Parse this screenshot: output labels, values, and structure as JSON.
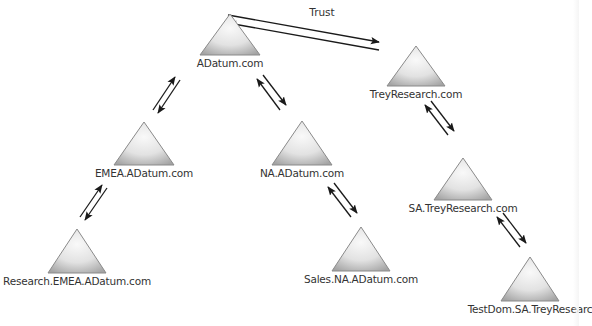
{
  "diagram": {
    "title": "",
    "trust_label": "Trust",
    "colors": {
      "triangle_stroke": "#8a8a8a",
      "triangle_fill_light": "#f7f7f7",
      "triangle_fill_dark": "#a8a8a8",
      "arrow": "#1a1a1a",
      "label_text": "#333333"
    },
    "nodes": [
      {
        "id": "adatum",
        "label": "ADatum.com",
        "cx": 230,
        "top": 14,
        "base": 55,
        "half": 30
      },
      {
        "id": "treyresearch",
        "label": "TreyResearch.com",
        "cx": 416,
        "top": 46,
        "base": 86,
        "half": 29
      },
      {
        "id": "emea",
        "label": "EMEA.ADatum.com",
        "cx": 144,
        "top": 122,
        "base": 165,
        "half": 30
      },
      {
        "id": "na",
        "label": "NA.ADatum.com",
        "cx": 302,
        "top": 121,
        "base": 165,
        "half": 30
      },
      {
        "id": "sa",
        "label": "SA.TreyResearch.com",
        "cx": 463,
        "top": 158,
        "base": 200,
        "half": 29
      },
      {
        "id": "research-emea",
        "label": "Research.EMEA.ADatum.com",
        "cx": 77,
        "top": 229,
        "base": 273,
        "half": 29
      },
      {
        "id": "sales-na",
        "label": "Sales.NA.ADatum.com",
        "cx": 361,
        "top": 227,
        "base": 271,
        "half": 29
      },
      {
        "id": "testdom-sa",
        "label": "TestDom.SA.TreyResearc",
        "cx": 530,
        "top": 257,
        "base": 301,
        "half": 29
      }
    ],
    "edges": [
      {
        "from": "adatum",
        "to": "treyresearch",
        "type": "trust",
        "a1": [
          228,
          15,
          379,
          42
        ],
        "a2": [
          379,
          50,
          228,
          23
        ]
      },
      {
        "from": "adatum",
        "to": "emea",
        "type": "parent-child",
        "a1": [
          153,
          110,
          175,
          77
        ],
        "a2": [
          180,
          80,
          158,
          113
        ]
      },
      {
        "from": "adatum",
        "to": "na",
        "type": "parent-child",
        "a1": [
          263,
          75,
          286,
          105
        ],
        "a2": [
          280,
          110,
          257,
          79
        ]
      },
      {
        "from": "emea",
        "to": "research-emea",
        "type": "parent-child",
        "a1": [
          80,
          217,
          102,
          185
        ],
        "a2": [
          107,
          188,
          85,
          220
        ]
      },
      {
        "from": "na",
        "to": "sales-na",
        "type": "parent-child",
        "a1": [
          334,
          183,
          357,
          213
        ],
        "a2": [
          351,
          217,
          328,
          187
        ]
      },
      {
        "from": "treyresearch",
        "to": "sa",
        "type": "parent-child",
        "a1": [
          431,
          101,
          454,
          131
        ],
        "a2": [
          448,
          135,
          425,
          105
        ]
      },
      {
        "from": "sa",
        "to": "testdom-sa",
        "type": "parent-child",
        "a1": [
          503,
          213,
          526,
          243
        ],
        "a2": [
          520,
          247,
          497,
          217
        ]
      }
    ],
    "trust_label_pos": {
      "x": 322,
      "y": 6
    }
  }
}
